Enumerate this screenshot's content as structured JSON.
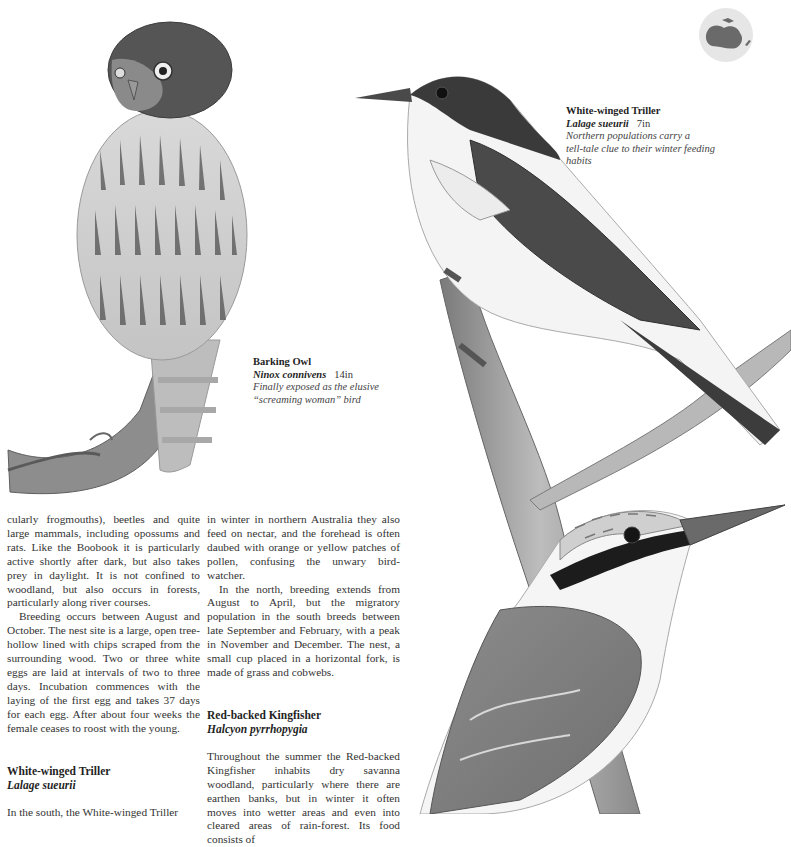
{
  "page": {
    "map_badge": {
      "icon": "australia-globe-icon",
      "fill": "#e6e6e6",
      "land": "#6a6a6a"
    },
    "illustrations": [
      {
        "name": "barking-owl-illustration",
        "subject": "Barking Owl perched on branch"
      },
      {
        "name": "white-winged-triller-illustration",
        "subject": "White-winged Triller perched on branch"
      },
      {
        "name": "red-backed-kingfisher-illustration",
        "subject": "Red-backed Kingfisher perched on branch"
      }
    ]
  },
  "captions": {
    "owl": {
      "common_name": "Barking Owl",
      "scientific_name": "Ninox connivens",
      "size": "14in",
      "description_line1": "Finally exposed as the elusive",
      "description_line2": "“screaming woman” bird"
    },
    "triller": {
      "common_name": "White-winged Triller",
      "scientific_name": "Lalage sueurii",
      "size": "7in",
      "description_line1": "Northern populations carry a",
      "description_line2": "tell-tale clue to their winter feeding",
      "description_line3": "habits"
    }
  },
  "columns": {
    "left": {
      "para1": "cularly frogmouths), beetles and quite large mammals, including opossums and rats. Like the Boobook it is particularly active shortly after dark, but also takes prey in daylight. It is not confined to woodland, but also occurs in forests, particularly along river courses.",
      "para2": "Breeding occurs between August and October. The nest site is a large, open tree-hollow lined with chips scraped from the surrounding wood. Two or three white eggs are laid at intervals of two to three days. Incubation commences with the laying of the first egg and takes 37 days for each egg. After about four weeks the female ceases to roost with the young.",
      "section_title": "White-winged Triller",
      "section_sci": "Lalage sueurii",
      "para3": "In the south, the White-winged Triller"
    },
    "right": {
      "para1": "in winter in northern Australia they also feed on nectar, and the forehead is often daubed with orange or yellow patches of pollen, confusing the unwary bird-watcher.",
      "para2": "In the north, breeding extends from August to April, but the migratory population in the south breeds between late September and February, with a peak in November and December. The nest, a small cup placed in a horizontal fork, is made of grass and cobwebs.",
      "section_title": "Red-backed Kingfisher",
      "section_sci": "Halcyon pyrrhopygia",
      "para3": "Throughout the summer the Red-backed Kingfisher inhabits dry savanna woodland, particularly where there are earthen banks, but in winter it often moves into wetter areas and even into cleared areas of rain-forest. Its food consists of"
    }
  }
}
